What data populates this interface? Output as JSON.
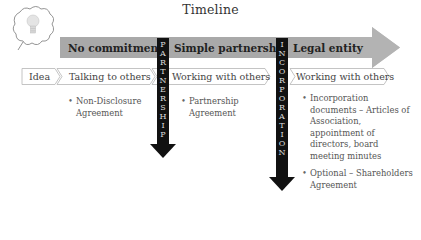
{
  "title": "Timeline",
  "icon": "lightbulb-thought-bubble-icon",
  "colors": {
    "band": "#a6a6a6",
    "band_head": "#b3b3b3",
    "milestone_bar": "#111111",
    "chevron_border": "#bfbfbf"
  },
  "stages": [
    {
      "label": "No commitment"
    },
    {
      "label": "Simple partnership"
    },
    {
      "label": "Legal entity"
    }
  ],
  "milestones": [
    {
      "label": "PARTNERSHIP",
      "letters": [
        "P",
        "A",
        "R",
        "T",
        "N",
        "E",
        "R",
        "S",
        "H",
        "I",
        "P"
      ]
    },
    {
      "label": "INCORPORATION",
      "letters": [
        "I",
        "N",
        "C",
        "O",
        "R",
        "P",
        "O",
        "R",
        "A",
        "T",
        "I",
        "O",
        "N"
      ]
    }
  ],
  "steps": [
    {
      "label": "Idea"
    },
    {
      "label": "Talking to others"
    },
    {
      "label": "Working with others"
    },
    {
      "label": "Working with others"
    }
  ],
  "documents": [
    {
      "items": [
        "Non-Disclosure Agreement"
      ]
    },
    {
      "items": [
        "Partnership Agreement"
      ]
    },
    {
      "items": [
        "Incorporation documents – Articles of Association, appointment of directors, board meeting minutes",
        "Optional – Shareholders Agreement"
      ]
    }
  ]
}
